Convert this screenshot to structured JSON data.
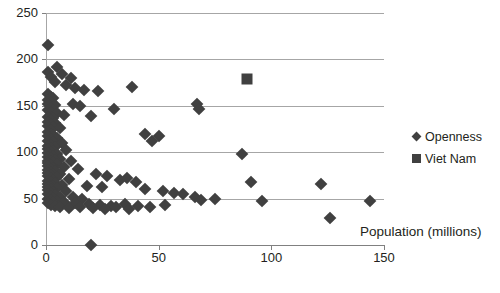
{
  "chart_data": {
    "type": "scatter",
    "title": "",
    "xlabel": "Population (millions)",
    "ylabel": "",
    "xlim": [
      0,
      150
    ],
    "ylim": [
      0,
      250
    ],
    "xticks": [
      0,
      50,
      100,
      150
    ],
    "yticks": [
      0,
      50,
      100,
      150,
      200,
      250
    ],
    "grid": "horizontal",
    "legend_position": "right",
    "marker_color": "#404040",
    "gridline_color": "#a6a6a6",
    "axis_color": "#808080",
    "series": [
      {
        "name": "Openness",
        "marker": "diamond",
        "points": [
          [
            1,
            215
          ],
          [
            1,
            186
          ],
          [
            2,
            181
          ],
          [
            5,
            192
          ],
          [
            7,
            184
          ],
          [
            11,
            180
          ],
          [
            4,
            176
          ],
          [
            9,
            172
          ],
          [
            13,
            169
          ],
          [
            17,
            167
          ],
          [
            23,
            166
          ],
          [
            38,
            170
          ],
          [
            1,
            163
          ],
          [
            2,
            160
          ],
          [
            3,
            158
          ],
          [
            1,
            156
          ],
          [
            2,
            154
          ],
          [
            1,
            152
          ],
          [
            4,
            151
          ],
          [
            12,
            152
          ],
          [
            15,
            150
          ],
          [
            67,
            152
          ],
          [
            68,
            147
          ],
          [
            30,
            147
          ],
          [
            2,
            148
          ],
          [
            3,
            146
          ],
          [
            1,
            145
          ],
          [
            2,
            143
          ],
          [
            5,
            142
          ],
          [
            8,
            140
          ],
          [
            20,
            139
          ],
          [
            1,
            138
          ],
          [
            3,
            137
          ],
          [
            2,
            135
          ],
          [
            1,
            133
          ],
          [
            4,
            132
          ],
          [
            2,
            130
          ],
          [
            1,
            128
          ],
          [
            3,
            127
          ],
          [
            6,
            126
          ],
          [
            2,
            124
          ],
          [
            1,
            122
          ],
          [
            44,
            120
          ],
          [
            50,
            117
          ],
          [
            47,
            112
          ],
          [
            2,
            120
          ],
          [
            3,
            118
          ],
          [
            1,
            117
          ],
          [
            5,
            115
          ],
          [
            2,
            114
          ],
          [
            1,
            112
          ],
          [
            3,
            111
          ],
          [
            7,
            110
          ],
          [
            2,
            108
          ],
          [
            1,
            107
          ],
          [
            4,
            106
          ],
          [
            2,
            104
          ],
          [
            1,
            103
          ],
          [
            9,
            102
          ],
          [
            3,
            101
          ],
          [
            87,
            98
          ],
          [
            2,
            100
          ],
          [
            1,
            99
          ],
          [
            5,
            98
          ],
          [
            3,
            96
          ],
          [
            1,
            95
          ],
          [
            2,
            94
          ],
          [
            6,
            93
          ],
          [
            4,
            92
          ],
          [
            1,
            91
          ],
          [
            2,
            90
          ],
          [
            11,
            90
          ],
          [
            3,
            89
          ],
          [
            1,
            88
          ],
          [
            5,
            87
          ],
          [
            2,
            86
          ],
          [
            1,
            85
          ],
          [
            8,
            84
          ],
          [
            3,
            83
          ],
          [
            2,
            82
          ],
          [
            1,
            81
          ],
          [
            14,
            82
          ],
          [
            4,
            80
          ],
          [
            2,
            79
          ],
          [
            1,
            78
          ],
          [
            6,
            77
          ],
          [
            3,
            76
          ],
          [
            2,
            75
          ],
          [
            22,
            77
          ],
          [
            27,
            74
          ],
          [
            1,
            74
          ],
          [
            5,
            73
          ],
          [
            2,
            72
          ],
          [
            10,
            71
          ],
          [
            3,
            70
          ],
          [
            1,
            69
          ],
          [
            33,
            70
          ],
          [
            36,
            72
          ],
          [
            40,
            68
          ],
          [
            2,
            68
          ],
          [
            4,
            67
          ],
          [
            1,
            66
          ],
          [
            7,
            65
          ],
          [
            3,
            64
          ],
          [
            2,
            63
          ],
          [
            1,
            62
          ],
          [
            18,
            64
          ],
          [
            25,
            63
          ],
          [
            5,
            61
          ],
          [
            2,
            60
          ],
          [
            1,
            59
          ],
          [
            9,
            58
          ],
          [
            3,
            57
          ],
          [
            2,
            56
          ],
          [
            44,
            60
          ],
          [
            52,
            58
          ],
          [
            57,
            56
          ],
          [
            61,
            55
          ],
          [
            1,
            55
          ],
          [
            4,
            54
          ],
          [
            2,
            53
          ],
          [
            6,
            52
          ],
          [
            3,
            51
          ],
          [
            1,
            50
          ],
          [
            12,
            52
          ],
          [
            16,
            50
          ],
          [
            66,
            52
          ],
          [
            69,
            48
          ],
          [
            75,
            50
          ],
          [
            91,
            68
          ],
          [
            96,
            47
          ],
          [
            122,
            66
          ],
          [
            126,
            29
          ],
          [
            144,
            47
          ],
          [
            2,
            48
          ],
          [
            5,
            47
          ],
          [
            3,
            46
          ],
          [
            1,
            45
          ],
          [
            8,
            46
          ],
          [
            13,
            45
          ],
          [
            19,
            44
          ],
          [
            24,
            43
          ],
          [
            29,
            42
          ],
          [
            35,
            44
          ],
          [
            41,
            42
          ],
          [
            46,
            41
          ],
          [
            53,
            43
          ],
          [
            2,
            43
          ],
          [
            4,
            42
          ],
          [
            6,
            41
          ],
          [
            10,
            40
          ],
          [
            15,
            41
          ],
          [
            21,
            40
          ],
          [
            26,
            39
          ],
          [
            31,
            41
          ],
          [
            37,
            39
          ],
          [
            20,
            0
          ]
        ]
      },
      {
        "name": "Viet Nam",
        "marker": "square",
        "points": [
          [
            89,
            179
          ]
        ]
      }
    ]
  },
  "legend": {
    "items": [
      {
        "label": "Openness",
        "marker": "diamond"
      },
      {
        "label": "Viet Nam",
        "marker": "square"
      }
    ]
  },
  "axes": {
    "x_title": "Population (millions)",
    "x_tick_labels": [
      "0",
      "50",
      "100",
      "150"
    ],
    "y_tick_labels": [
      "0",
      "50",
      "100",
      "150",
      "200",
      "250"
    ]
  }
}
